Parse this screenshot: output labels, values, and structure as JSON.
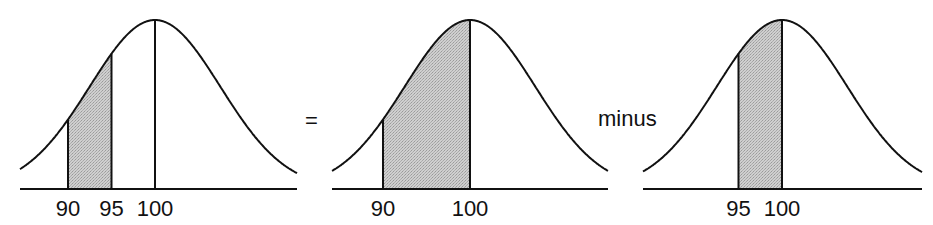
{
  "diagram": {
    "mean": 100,
    "sd": 7.5,
    "colors": {
      "line": "#111111",
      "shade": "#c4c4c4",
      "background": "#ffffff"
    },
    "operators": {
      "equals": "=",
      "minus": "minus"
    },
    "panels": [
      {
        "id": "panel-90-95",
        "x_left": 20,
        "x_right": 297,
        "peak_x": 155,
        "shade_from": 90,
        "shade_to": 95,
        "verticals": [
          90,
          95,
          100
        ],
        "tick_labels": [
          {
            "value": 90,
            "text": "90"
          },
          {
            "value": 95,
            "text": "95"
          },
          {
            "value": 100,
            "text": "100"
          }
        ]
      },
      {
        "id": "panel-90-100",
        "x_left": 332,
        "x_right": 608,
        "peak_x": 470,
        "shade_from": 90,
        "shade_to": 100,
        "verticals": [
          90,
          100
        ],
        "tick_labels": [
          {
            "value": 90,
            "text": "90"
          },
          {
            "value": 100,
            "text": "100"
          }
        ]
      },
      {
        "id": "panel-95-100",
        "x_left": 643,
        "x_right": 922,
        "peak_x": 782,
        "shade_from": 95,
        "shade_to": 100,
        "verticals": [
          95,
          100
        ],
        "tick_labels": [
          {
            "value": 95,
            "text": "95"
          },
          {
            "value": 100,
            "text": "100"
          }
        ]
      }
    ]
  }
}
